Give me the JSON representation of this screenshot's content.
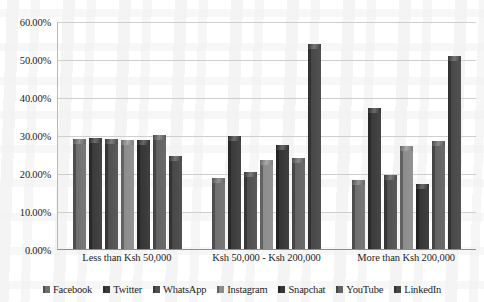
{
  "chart_data": {
    "type": "bar",
    "title": "",
    "xlabel": "",
    "ylabel": "",
    "grid": true,
    "legend_position": "bottom",
    "ylim": [
      0,
      0.6
    ],
    "ytick_labels": [
      "60.00%",
      "50.00%",
      "40.00%",
      "30.00%",
      "20.00%",
      "10.00%",
      "0.00%"
    ],
    "ytick_values": [
      0.6,
      0.5,
      0.4,
      0.3,
      0.2,
      0.1,
      0.0
    ],
    "categories": [
      "Less than Ksh 50,000",
      "Ksh 50,000 - Ksh 200,000",
      "More than Ksh 200,000"
    ],
    "series": [
      {
        "name": "Facebook",
        "color": "#6f6f6f",
        "values": [
          0.289,
          0.188,
          0.182
        ]
      },
      {
        "name": "Twitter",
        "color": "#3a3a3a",
        "values": [
          0.291,
          0.297,
          0.37
        ]
      },
      {
        "name": "WhatsApp",
        "color": "#4f4f4f",
        "values": [
          0.29,
          0.203,
          0.195
        ]
      },
      {
        "name": "Instagram",
        "color": "#8c8c8c",
        "values": [
          0.286,
          0.234,
          0.27
        ]
      },
      {
        "name": "Snapchat",
        "color": "#343434",
        "values": [
          0.287,
          0.273,
          0.17
        ]
      },
      {
        "name": "YouTube",
        "color": "#626262",
        "values": [
          0.3,
          0.24,
          0.285
        ]
      },
      {
        "name": "LinkedIn",
        "color": "#474747",
        "values": [
          0.245,
          0.54,
          0.508
        ]
      }
    ]
  }
}
